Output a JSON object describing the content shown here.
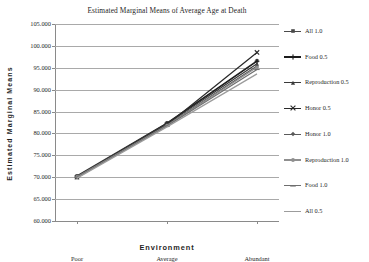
{
  "chart_data": {
    "type": "line",
    "title": "Estimated Marginal Means of Average Age at Death",
    "xlabel": "Environment",
    "ylabel": "Estimated Marginal Means",
    "categories": [
      "Poor",
      "Average",
      "Abundant"
    ],
    "ylim": [
      60.0,
      105.0
    ],
    "ytick_step": 5.0,
    "ytick_labels": [
      "105.000",
      "100.000",
      "95.000",
      "90.000",
      "85.000",
      "80.000",
      "75.000",
      "70.000",
      "65.000",
      "60.000"
    ],
    "ytick_values": [
      105.0,
      100.0,
      95.0,
      90.0,
      85.0,
      80.0,
      75.0,
      70.0,
      65.0,
      60.0
    ],
    "grid": true,
    "legend_position": "right",
    "series": [
      {
        "name": "All 1.0",
        "values": [
          70.3,
          82.4,
          96.6
        ],
        "color": "#4a4a4a",
        "marker": "square"
      },
      {
        "name": "Food 0.5",
        "values": [
          70.1,
          82.3,
          96.5
        ],
        "color": "#1c1c1c",
        "marker": "plus"
      },
      {
        "name": "Reproduction 0.5",
        "values": [
          70.2,
          82.2,
          95.9
        ],
        "color": "#3a3a3a",
        "marker": "triangle"
      },
      {
        "name": "Honor 0.5",
        "values": [
          70.0,
          82.0,
          98.5
        ],
        "color": "#2a2a2a",
        "marker": "cross"
      },
      {
        "name": "Honor 1.0",
        "values": [
          69.9,
          81.9,
          95.4
        ],
        "color": "#5a5a5a",
        "marker": "diamond"
      },
      {
        "name": "Reproduction 1.0",
        "values": [
          70.1,
          81.8,
          95.1
        ],
        "color": "#8f8f8f",
        "marker": "circle"
      },
      {
        "name": "Food 1.0",
        "values": [
          70.0,
          81.7,
          94.6
        ],
        "color": "#6e6e6e",
        "marker": "line"
      },
      {
        "name": "All 0.5",
        "values": [
          69.8,
          81.5,
          93.6
        ],
        "color": "#9c9c9c",
        "marker": "none"
      }
    ]
  }
}
